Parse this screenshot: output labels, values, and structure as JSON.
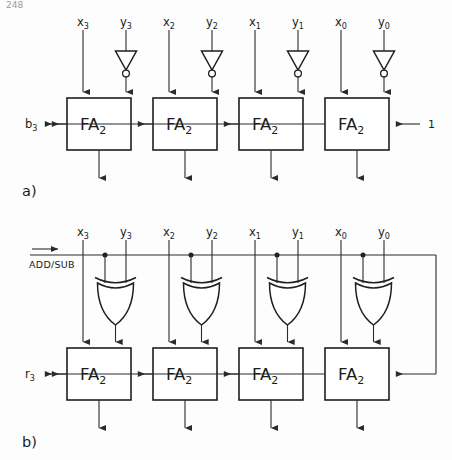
{
  "figure": {
    "page_header": "248",
    "background_color": "#fdfdfd",
    "ink_color": "#1f1f1f"
  },
  "panels": [
    {
      "id": "a",
      "caption": "a)",
      "description": "Subtractor: each y input passes through an inverter, carry-in of least significant stage tied to 1",
      "block_label": "FA",
      "block_sub": "2",
      "blocks": [
        {
          "index": 0,
          "label": "FA",
          "sub": "2",
          "x_label": "x",
          "x_sub": "3",
          "y_label": "y",
          "y_sub": "3",
          "inverted": true
        },
        {
          "index": 1,
          "label": "FA",
          "sub": "2",
          "x_label": "x",
          "x_sub": "2",
          "y_label": "y",
          "y_sub": "2",
          "inverted": true
        },
        {
          "index": 2,
          "label": "FA",
          "sub": "2",
          "x_label": "x",
          "x_sub": "1",
          "y_label": "y",
          "y_sub": "1",
          "inverted": true
        },
        {
          "index": 3,
          "label": "FA",
          "sub": "2",
          "x_label": "x",
          "x_sub": "0",
          "y_label": "y",
          "y_sub": "0",
          "inverted": true
        }
      ],
      "carry_out_label": "b",
      "carry_out_sub": "3",
      "carry_in_label": "1"
    },
    {
      "id": "b",
      "caption": "b)",
      "description": "Adder/subtractor: control line ADD/SUB drives one XOR input per stage and the carry-in of the least significant stage",
      "control_label": "ADD / SUB",
      "control_label_raw": "ADD/SUB",
      "gate_type": "xor-gate",
      "blocks": [
        {
          "index": 0,
          "label": "FA",
          "sub": "2",
          "x_label": "x",
          "x_sub": "3",
          "y_label": "y",
          "y_sub": "3",
          "gate": "xor"
        },
        {
          "index": 1,
          "label": "FA",
          "sub": "2",
          "x_label": "x",
          "x_sub": "2",
          "y_label": "y",
          "y_sub": "2",
          "gate": "xor"
        },
        {
          "index": 2,
          "label": "FA",
          "sub": "2",
          "x_label": "x",
          "x_sub": "1",
          "y_label": "y",
          "y_sub": "1",
          "gate": "xor"
        },
        {
          "index": 3,
          "label": "FA",
          "sub": "2",
          "x_label": "x",
          "x_sub": "0",
          "y_label": "y",
          "y_sub": "0",
          "gate": "xor"
        }
      ],
      "carry_out_label": "r",
      "carry_out_sub": "3"
    }
  ]
}
